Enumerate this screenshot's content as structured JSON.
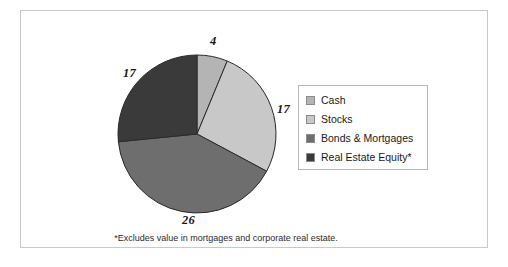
{
  "figure": {
    "border_color": "#c9c9c9",
    "background": "#ffffff"
  },
  "footnote": "*Excludes value in mortgages and corporate real estate.",
  "legend": {
    "border_color": "#b8b8b8",
    "items": [
      {
        "label": "Cash",
        "color": "#b4b4b4"
      },
      {
        "label": "Stocks",
        "color": "#c8c8c8"
      },
      {
        "label": "Bonds & Mortgages",
        "color": "#6e6e6e"
      },
      {
        "label": "Real Estate Equity*",
        "color": "#3a3a3a"
      }
    ]
  },
  "chart_data": {
    "type": "pie",
    "title": "",
    "xlabel": "",
    "ylabel": "",
    "categories": [
      "Cash",
      "Stocks",
      "Bonds & Mortgages",
      "Real Estate Equity*"
    ],
    "values": [
      4,
      17,
      26,
      17
    ],
    "total": 64,
    "colors": [
      "#b4b4b4",
      "#c8c8c8",
      "#6e6e6e",
      "#3a3a3a"
    ],
    "slice_order": "clockwise from 12 o'clock",
    "legend_position": "right",
    "grid": false,
    "data_labels": {
      "cash": "4",
      "stocks": "17",
      "bonds": "26",
      "real_estate": "17"
    },
    "annotations": [
      "*Excludes value in mortgages and corporate real estate."
    ],
    "geometry": {
      "center_x": 80,
      "center_y": 80,
      "radius": 79,
      "stroke": "#2a2a2a"
    }
  }
}
